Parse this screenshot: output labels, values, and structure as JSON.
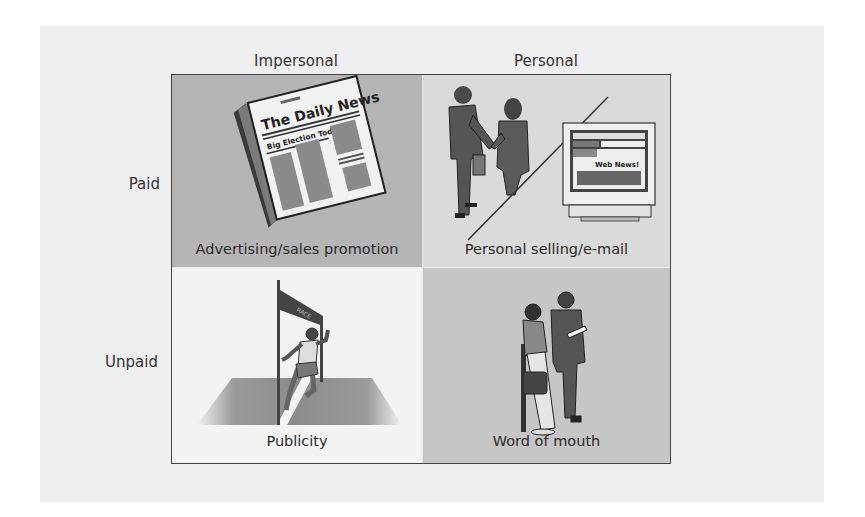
{
  "diagram": {
    "column_headers": [
      "Impersonal",
      "Personal"
    ],
    "row_headers": [
      "Paid",
      "Unpaid"
    ],
    "cells": [
      {
        "row": "Paid",
        "column": "Impersonal",
        "caption": "Advertising/sales promotion",
        "illustration": "newspaper-icon",
        "illustration_text": {
          "masthead": "The Daily News",
          "headline": "Big Election Today"
        },
        "background": "#b5b5b5"
      },
      {
        "row": "Paid",
        "column": "Personal",
        "caption": "Personal selling/e-mail",
        "illustration": "handshake-and-computer-icon",
        "illustration_text": {
          "screen": "Web News!"
        },
        "background": "#dadada"
      },
      {
        "row": "Unpaid",
        "column": "Impersonal",
        "caption": "Publicity",
        "illustration": "runner-finish-line-icon",
        "illustration_text": {
          "banner": "RACE"
        },
        "background": "#f3f3f3"
      },
      {
        "row": "Unpaid",
        "column": "Personal",
        "caption": "Word of mouth",
        "illustration": "two-people-talking-icon",
        "background": "#c6c6c6"
      }
    ]
  },
  "colors": {
    "panel_background": "#efefef",
    "grid_border": "#444444",
    "text": "#2b2b2b"
  }
}
